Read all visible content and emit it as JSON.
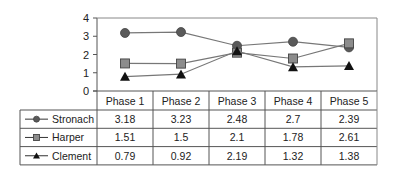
{
  "chart_data": {
    "type": "line",
    "title": "",
    "xlabel": "",
    "ylabel": "",
    "ylim": [
      0,
      4
    ],
    "yticks": [
      0,
      1,
      2,
      3,
      4
    ],
    "grid": false,
    "legend_position": "data-table-left",
    "categories": [
      "Phase 1",
      "Phase 2",
      "Phase 3",
      "Phase 4",
      "Phase 5"
    ],
    "series": [
      {
        "name": "Stronach",
        "marker": "circle",
        "marker_color": "#5a5a5a",
        "values": [
          3.18,
          3.23,
          2.48,
          2.7,
          2.39
        ]
      },
      {
        "name": "Harper",
        "marker": "square",
        "marker_color": "#8c8c8c",
        "values": [
          1.51,
          1.5,
          2.1,
          1.78,
          2.61
        ]
      },
      {
        "name": "Clement",
        "marker": "triangle",
        "marker_color": "#111111",
        "values": [
          0.79,
          0.92,
          2.19,
          1.32,
          1.38
        ]
      }
    ],
    "data_table": {
      "header": [
        "Phase 1",
        "Phase 2",
        "Phase 3",
        "Phase 4",
        "Phase 5"
      ],
      "rows": [
        {
          "label": "Stronach",
          "cells": [
            "3.18",
            "3.23",
            "2.48",
            "2.7",
            "2.39"
          ]
        },
        {
          "label": "Harper",
          "cells": [
            "1.51",
            "1.5",
            "2.1",
            "1.78",
            "2.61"
          ]
        },
        {
          "label": "Clement",
          "cells": [
            "0.79",
            "0.92",
            "2.19",
            "1.32",
            "1.38"
          ]
        }
      ]
    }
  }
}
